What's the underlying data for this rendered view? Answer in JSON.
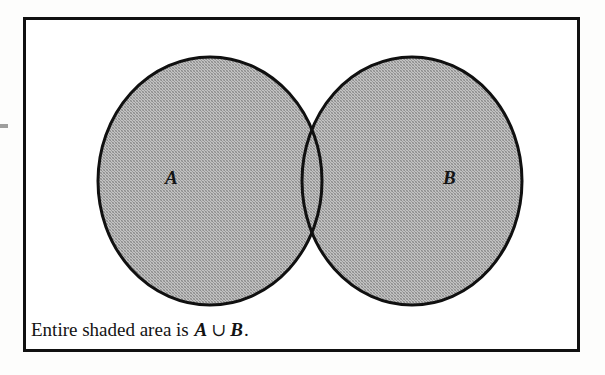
{
  "figure": {
    "kind": "venn-diagram",
    "background_color": "#ffffff",
    "frame": {
      "border_color": "#111111",
      "border_width_px": 3,
      "x": 23,
      "y": 17,
      "width": 557,
      "height": 335
    },
    "shading": {
      "fill_color": "#ababab",
      "outline_color": "#101010",
      "outline_width_px": 3,
      "pattern": "halftone-dither-gray"
    },
    "sets": [
      {
        "id": "A",
        "label": "A",
        "label_x": 172,
        "label_y": 178,
        "center_x": 210,
        "center_y": 181,
        "radius_x": 112,
        "radius_y": 124,
        "shaded": true
      },
      {
        "id": "B",
        "label": "B",
        "label_x": 450,
        "label_y": 178,
        "center_x": 412,
        "center_y": 181,
        "radius_x": 110,
        "radius_y": 124,
        "shaded": true
      }
    ],
    "intersection": {
      "shaded": true,
      "top_point_x": 308,
      "top_point_y": 95,
      "bottom_point_x": 308,
      "bottom_point_y": 270
    },
    "caption": {
      "prefix": "Entire shaded area is ",
      "first_set": "A",
      "operator": "∪",
      "second_set": "B",
      "suffix": ".",
      "full_text": "Entire shaded area is A ∪ B."
    }
  }
}
